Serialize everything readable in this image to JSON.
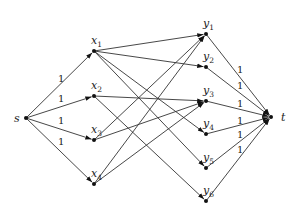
{
  "diagram": {
    "type": "bipartite flow network",
    "nodes": {
      "s": {
        "label": "s",
        "sub": "",
        "x": 26,
        "y": 118,
        "lx": 14,
        "ly": 122
      },
      "x1": {
        "label": "x",
        "sub": "1",
        "x": 94,
        "y": 51,
        "lx": 91,
        "ly": 44
      },
      "x2": {
        "label": "x",
        "sub": "2",
        "x": 94,
        "y": 96,
        "lx": 91,
        "ly": 89
      },
      "x3": {
        "label": "x",
        "sub": "3",
        "x": 94,
        "y": 140,
        "lx": 91,
        "ly": 133
      },
      "x4": {
        "label": "x",
        "sub": "4",
        "x": 94,
        "y": 184,
        "lx": 91,
        "ly": 177
      },
      "y1": {
        "label": "y",
        "sub": "1",
        "x": 206,
        "y": 34,
        "lx": 203,
        "ly": 27
      },
      "y2": {
        "label": "y",
        "sub": "2",
        "x": 206,
        "y": 67,
        "lx": 203,
        "ly": 60
      },
      "y3": {
        "label": "y",
        "sub": "3",
        "x": 206,
        "y": 101,
        "lx": 203,
        "ly": 94
      },
      "y4": {
        "label": "y",
        "sub": "4",
        "x": 206,
        "y": 134,
        "lx": 203,
        "ly": 127
      },
      "y5": {
        "label": "y",
        "sub": "5",
        "x": 206,
        "y": 168,
        "lx": 203,
        "ly": 161
      },
      "y6": {
        "label": "y",
        "sub": "6",
        "x": 206,
        "y": 201,
        "lx": 203,
        "ly": 194
      },
      "t": {
        "label": "t",
        "sub": "",
        "x": 271,
        "y": 117,
        "lx": 281,
        "ly": 121
      }
    },
    "edges": [
      {
        "from": "s",
        "to": "x1",
        "label": "1",
        "lx": 58,
        "ly": 82
      },
      {
        "from": "s",
        "to": "x2",
        "label": "1",
        "lx": 58,
        "ly": 102
      },
      {
        "from": "s",
        "to": "x3",
        "label": "1",
        "lx": 58,
        "ly": 124
      },
      {
        "from": "s",
        "to": "x4",
        "label": "1",
        "lx": 58,
        "ly": 145
      },
      {
        "from": "x1",
        "to": "y1",
        "label": ""
      },
      {
        "from": "x1",
        "to": "y2",
        "label": ""
      },
      {
        "from": "x1",
        "to": "y4",
        "label": ""
      },
      {
        "from": "x1",
        "to": "y5",
        "label": ""
      },
      {
        "from": "x2",
        "to": "y3",
        "label": ""
      },
      {
        "from": "x2",
        "to": "y6",
        "label": ""
      },
      {
        "from": "x3",
        "to": "y1",
        "label": ""
      },
      {
        "from": "x3",
        "to": "y3",
        "label": ""
      },
      {
        "from": "x4",
        "to": "y1",
        "label": ""
      },
      {
        "from": "x4",
        "to": "y3",
        "label": ""
      },
      {
        "from": "y1",
        "to": "t",
        "label": "1",
        "lx": 237,
        "ly": 73
      },
      {
        "from": "y2",
        "to": "t",
        "label": "1",
        "lx": 237,
        "ly": 89
      },
      {
        "from": "y3",
        "to": "t",
        "label": "1",
        "lx": 237,
        "ly": 107
      },
      {
        "from": "y4",
        "to": "t",
        "label": "1",
        "lx": 237,
        "ly": 124
      },
      {
        "from": "y5",
        "to": "t",
        "label": "1",
        "lx": 237,
        "ly": 138
      },
      {
        "from": "y6",
        "to": "t",
        "label": "1",
        "lx": 237,
        "ly": 153
      }
    ]
  }
}
